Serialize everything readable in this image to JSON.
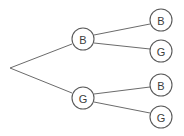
{
  "diagram": {
    "type": "tree",
    "background_color": "#ffffff",
    "edge_color": "#6b6b6b",
    "node_fill_color": "#ffffff",
    "node_stroke_color": "#5a5a5a",
    "label_color": "#3d3d3d",
    "node_radius": 11,
    "root": {
      "x": 10,
      "y": 68
    },
    "nodes": [
      {
        "id": "n1",
        "label": "B",
        "x": 83,
        "y": 39,
        "level": 1
      },
      {
        "id": "n2",
        "label": "G",
        "x": 83,
        "y": 98,
        "level": 1
      },
      {
        "id": "n3",
        "label": "B",
        "x": 161,
        "y": 20,
        "level": 2
      },
      {
        "id": "n4",
        "label": "G",
        "x": 161,
        "y": 51,
        "level": 2
      },
      {
        "id": "n5",
        "label": "B",
        "x": 161,
        "y": 85,
        "level": 2
      },
      {
        "id": "n6",
        "label": "G",
        "x": 161,
        "y": 117,
        "level": 2
      }
    ],
    "edges": [
      {
        "id": "e1",
        "from": "root",
        "to": "n1",
        "x1": 10,
        "y1": 68,
        "x2": 72,
        "y2": 44
      },
      {
        "id": "e2",
        "from": "root",
        "to": "n2",
        "x1": 10,
        "y1": 68,
        "x2": 72,
        "y2": 93
      },
      {
        "id": "e3",
        "from": "n1",
        "to": "n3",
        "x1": 94,
        "y1": 35,
        "x2": 150,
        "y2": 24
      },
      {
        "id": "e4",
        "from": "n1",
        "to": "n4",
        "x1": 94,
        "y1": 43,
        "x2": 150,
        "y2": 49
      },
      {
        "id": "e5",
        "from": "n2",
        "to": "n5",
        "x1": 94,
        "y1": 94,
        "x2": 150,
        "y2": 87
      },
      {
        "id": "e6",
        "from": "n2",
        "to": "n6",
        "x1": 94,
        "y1": 102,
        "x2": 150,
        "y2": 113
      }
    ]
  }
}
